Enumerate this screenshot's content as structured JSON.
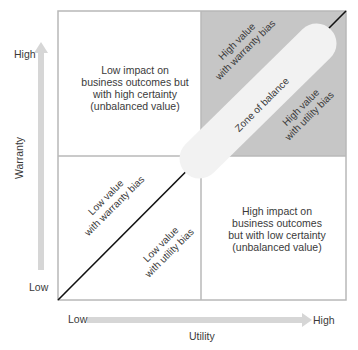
{
  "diagram": {
    "y_axis": {
      "title": "Warranty",
      "high_label": "High",
      "low_label": "Low"
    },
    "x_axis": {
      "title": "Utility",
      "low_label": "Low",
      "high_label": "High"
    },
    "quadrants": {
      "top_left": [
        "Low impact on",
        "business outcomes but",
        "with high certainty",
        "(unbalanced value)"
      ],
      "bottom_right": [
        "High impact on",
        "business outcomes",
        "but with low certainty",
        "(unbalanced value)"
      ]
    },
    "diagonal_labels": {
      "high_warranty": [
        "High value",
        "with warranty bias"
      ],
      "high_utility": [
        "High value",
        "with utility bias"
      ],
      "low_warranty": [
        "Low value",
        "with warranty bias"
      ],
      "low_utility": [
        "Low value",
        "with utility bias"
      ],
      "zone": "Zone of balance"
    },
    "colors": {
      "border": "#b8b8b8",
      "highlight_quadrant": "#c6c6c6",
      "zone_fill": "#f2f2f2",
      "arrow": "#d6d6d6",
      "diagonal": "#111111"
    }
  }
}
